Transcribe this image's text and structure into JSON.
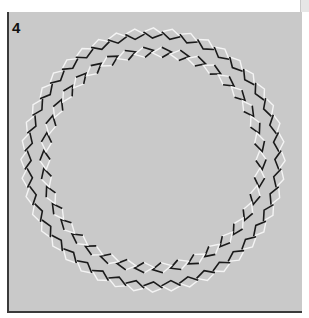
{
  "figure": {
    "panel_label": "4",
    "illusion_name": "rotating-rings",
    "colors": {
      "background": "#c9c9c9",
      "border": "#3a3a3a",
      "dark_edge": "#1a1a1a",
      "light_edge": "#f4f4f4",
      "page": "#ffffff"
    },
    "rings": [
      {
        "name": "outer-ring",
        "cx": 153,
        "cy": 160,
        "radius": 127,
        "count": 44,
        "tilt": 1
      },
      {
        "name": "inner-ring",
        "cx": 153,
        "cy": 160,
        "radius": 108,
        "count": 38,
        "tilt": -1
      }
    ]
  }
}
